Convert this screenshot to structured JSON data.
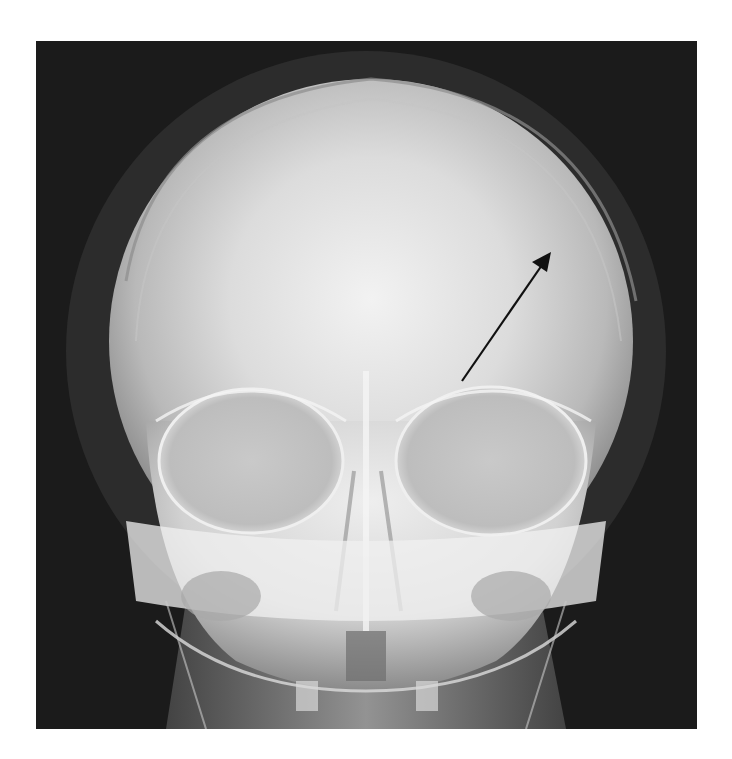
{
  "figure": {
    "type": "radiograph",
    "view": "skull-frontal",
    "background_color": "#ffffff",
    "film_color": "#1b1b1b",
    "bone_color": "#e6e6e6",
    "annotation": {
      "kind": "arrow",
      "color": "#111111",
      "from": [
        462,
        381
      ],
      "to": [
        551,
        253
      ],
      "label": ""
    }
  }
}
